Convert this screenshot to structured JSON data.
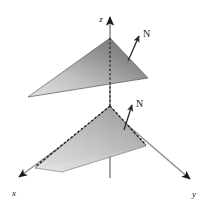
{
  "figure": {
    "background_color": "#ffffff",
    "width": 206,
    "height": 202
  },
  "axes": {
    "origin": {
      "x": 110,
      "y": 110
    },
    "color": "#6e6e6e",
    "items": [
      {
        "name": "z-axis",
        "label": "z",
        "label_x": 101,
        "label_y": 20,
        "start_x": 110,
        "start_y": 178,
        "end_x": 110,
        "end_y": 16,
        "arrow": true,
        "style": "solid"
      },
      {
        "name": "x-axis",
        "label": "x",
        "label_x": 14,
        "label_y": 195,
        "start_x": 110,
        "start_y": 110,
        "end_x": 17,
        "end_y": 178,
        "arrow": true,
        "style": "solid"
      },
      {
        "name": "y-axis",
        "label": "y",
        "label_x": 194,
        "label_y": 196,
        "start_x": 110,
        "start_y": 110,
        "end_x": 192,
        "end_y": 180,
        "arrow": true,
        "style": "solid"
      }
    ]
  },
  "surfaces": [
    {
      "name": "upper-triangle",
      "description": "Upper triangular plane above the origin",
      "vertices": [
        {
          "x": 110,
          "y": 38
        },
        {
          "x": 148,
          "y": 78
        },
        {
          "x": 28,
          "y": 97
        }
      ],
      "fill_light": "#d8d8d8",
      "fill_dark": "#6f6f6f",
      "edge_color": "#4a4a4a"
    },
    {
      "name": "lower-triangle",
      "description": "Lower triangular plane resting near the origin with hidden dashed edges",
      "vertices": [
        {
          "x": 110,
          "y": 106
        },
        {
          "x": 146,
          "y": 145
        },
        {
          "x": 35,
          "y": 168
        }
      ],
      "fill_light": "#dedede",
      "fill_dark": "#8a8a8a",
      "edge_color": "#4a4a4a"
    }
  ],
  "hidden_edges": {
    "name": "dashed-hidden-edges",
    "color": "#1a1a1a",
    "dash": "2 2",
    "segments": [
      {
        "x1": 110,
        "y1": 106,
        "x2": 146,
        "y2": 145
      },
      {
        "x1": 110,
        "y1": 106,
        "x2": 35,
        "y2": 168
      },
      {
        "x1": 110,
        "y1": 38,
        "x2": 110,
        "y2": 106
      }
    ]
  },
  "normals": [
    {
      "name": "normal-vector-upper",
      "label": "N",
      "tail_x": 128,
      "tail_y": 60,
      "tip_x": 140,
      "tip_y": 35,
      "label_x": 143,
      "label_y": 36,
      "color": "#3a3a3a"
    },
    {
      "name": "normal-vector-lower",
      "label": "N",
      "tail_x": 124,
      "tail_y": 130,
      "tip_x": 133,
      "tip_y": 104,
      "label_x": 136,
      "label_y": 106,
      "color": "#3a3a3a"
    }
  ]
}
